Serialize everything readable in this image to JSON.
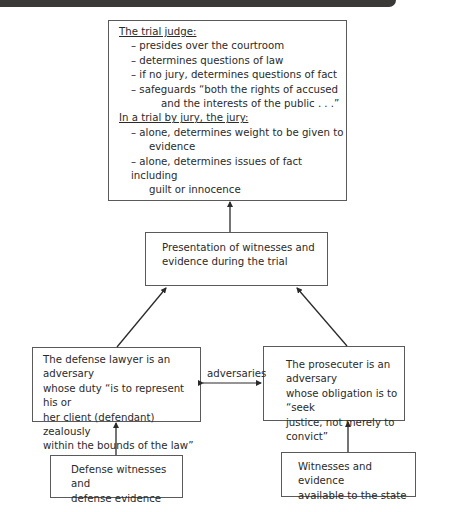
{
  "diagram": {
    "judge_box": {
      "heading": "The trial judge:",
      "judge_items": [
        "– presides over the courtroom",
        "– determines questions of law",
        "– if no jury, determines questions of fact",
        "– safeguards “both the rights of accused",
        "and the interests of the public . . .”"
      ],
      "jury_heading": "In a trial by jury, the jury:",
      "jury_items": [
        "– alone, determines weight to be given to",
        "evidence",
        "– alone, determines issues of fact including",
        "guilt or innocence"
      ]
    },
    "presentation_box": {
      "lines": [
        "Presentation of witnesses and",
        "evidence during the trial"
      ]
    },
    "defense_box": {
      "lines": [
        "The defense lawyer is an adversary",
        "whose duty “is to represent his or",
        "her client (defendant) zealously",
        "within the bounds of the law”"
      ]
    },
    "prosecutor_box": {
      "lines": [
        "The prosecuter is an adversary",
        "whose obligation is to “seek",
        "justice, not merely to convict”"
      ]
    },
    "adversaries_label": "adversaries",
    "defense_witness_box": {
      "lines": [
        "Defense witnesses and",
        "defense evidence"
      ]
    },
    "state_witness_box": {
      "lines": [
        "Witnesses and evidence",
        "available to the state"
      ]
    },
    "colors": {
      "top_bar": "#3b3838",
      "border": "#5a5a5a",
      "text": "#2a2a2a"
    }
  }
}
